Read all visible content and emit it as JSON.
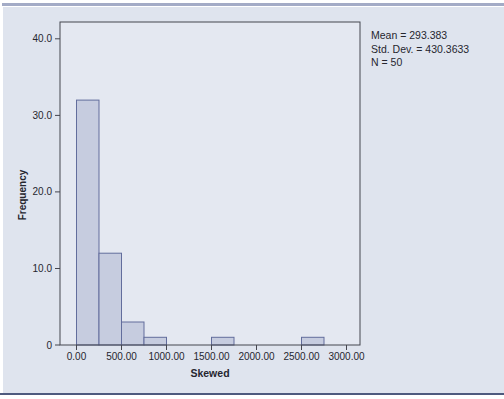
{
  "chart_data": {
    "type": "bar",
    "subtype": "histogram",
    "title": "",
    "xlabel": "Skewed",
    "ylabel": "Frequency",
    "bin_width": 250,
    "bins": [
      {
        "start": 0,
        "end": 250,
        "frequency": 32
      },
      {
        "start": 250,
        "end": 500,
        "frequency": 12
      },
      {
        "start": 500,
        "end": 750,
        "frequency": 3
      },
      {
        "start": 750,
        "end": 1000,
        "frequency": 1
      },
      {
        "start": 1500,
        "end": 1750,
        "frequency": 1
      },
      {
        "start": 2500,
        "end": 2750,
        "frequency": 1
      }
    ],
    "x_ticks": [
      0,
      500,
      1000,
      1500,
      2000,
      2500,
      3000
    ],
    "x_tick_labels": [
      "0.00",
      "500.00",
      "1000.00",
      "1500.00",
      "2000.00",
      "2500.00",
      "3000.00"
    ],
    "y_ticks": [
      0,
      10,
      20,
      30,
      40
    ],
    "y_tick_labels": [
      "0",
      "10.0",
      "20.0",
      "30.0",
      "40.0"
    ],
    "xlim": [
      -183,
      3150
    ],
    "ylim": [
      0,
      42.2
    ],
    "grid": false,
    "legend": false
  },
  "stats": {
    "mean": "Mean = 293.383",
    "std_dev": "Std. Dev. = 430.3633",
    "n": "N = 50"
  },
  "colors": {
    "page_bg": "#ffffff",
    "canvas_bg": "#dfe4ee",
    "plot_bg": "#e4e8f1",
    "bar_fill": "#c6ccdf",
    "bar_border": "#626d9c",
    "frame": "#45464f",
    "text": "#26262e",
    "top_band": "#a3abc6",
    "bottom_rule": "#4e5a7e"
  }
}
